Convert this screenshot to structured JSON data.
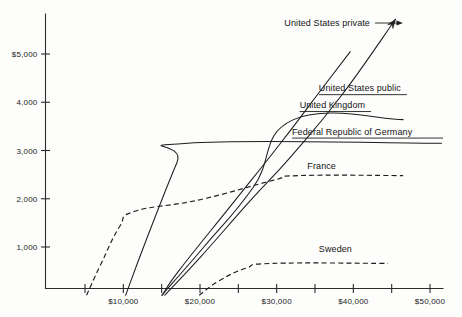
{
  "chart_data": {
    "type": "line",
    "title": "",
    "subtitle": "",
    "xlabel": "",
    "ylabel": "",
    "xlim": [
      0,
      52000
    ],
    "ylim": [
      0,
      5800
    ],
    "grid": false,
    "legend_position": "inline-right-of-series",
    "x_ticks": [
      {
        "value": 5000,
        "label": ""
      },
      {
        "value": 10000,
        "label": "$10,000"
      },
      {
        "value": 15000,
        "label": ""
      },
      {
        "value": 20000,
        "label": "$20,000"
      },
      {
        "value": 25000,
        "label": ""
      },
      {
        "value": 30000,
        "label": "$30,000"
      },
      {
        "value": 35000,
        "label": ""
      },
      {
        "value": 40000,
        "label": "$40,000"
      },
      {
        "value": 45000,
        "label": ""
      },
      {
        "value": 50000,
        "label": "$50,000"
      }
    ],
    "y_ticks": [
      {
        "value": 1000,
        "label": "1,000"
      },
      {
        "value": 2000,
        "label": "2,000"
      },
      {
        "value": 3000,
        "label": "3,000"
      },
      {
        "value": 4000,
        "label": "4,000"
      },
      {
        "value": 5000,
        "label": "$5,000"
      }
    ],
    "series": [
      {
        "name": "United States private",
        "label": "United States private",
        "style": "solid",
        "has_arrow": true,
        "has_pointer": true,
        "underline": false,
        "label_x": 31000,
        "label_y": 5580,
        "points": [
          {
            "x": 15400,
            "y": 0
          },
          {
            "x": 20000,
            "y": 780
          },
          {
            "x": 26500,
            "y": 1950
          },
          {
            "x": 32000,
            "y": 2900
          },
          {
            "x": 38500,
            "y": 4150
          },
          {
            "x": 45500,
            "y": 5720
          }
        ]
      },
      {
        "name": "United States public",
        "label": "United States public",
        "style": "solid",
        "has_arrow": false,
        "has_pointer": false,
        "underline": true,
        "label_x": 35500,
        "label_y": 4230,
        "points": [
          {
            "x": 15100,
            "y": 0
          },
          {
            "x": 17300,
            "y": 520
          },
          {
            "x": 24500,
            "y": 1950
          },
          {
            "x": 30500,
            "y": 3150
          },
          {
            "x": 36000,
            "y": 4300
          },
          {
            "x": 39600,
            "y": 5050
          }
        ]
      },
      {
        "name": "United Kingdom",
        "label": "United Kingdom",
        "style": "solid",
        "has_arrow": false,
        "has_pointer": false,
        "underline": true,
        "label_x": 33000,
        "label_y": 3880,
        "points": [
          {
            "x": 15000,
            "y": 0
          },
          {
            "x": 20500,
            "y": 1000
          },
          {
            "x": 27000,
            "y": 2250
          },
          {
            "x": 32200,
            "y": 3640
          },
          {
            "x": 46500,
            "y": 3640
          }
        ]
      },
      {
        "name": "Federal Republic of Germany",
        "label": "Federal Republic of Germany",
        "style": "solid",
        "has_arrow": false,
        "has_pointer": false,
        "underline": true,
        "label_x": 32000,
        "label_y": 3330,
        "points": [
          {
            "x": 10300,
            "y": 0
          },
          {
            "x": 13000,
            "y": 1150
          },
          {
            "x": 17000,
            "y": 2750
          },
          {
            "x": 18400,
            "y": 3150
          },
          {
            "x": 51500,
            "y": 3150
          }
        ]
      },
      {
        "name": "France",
        "label": "France",
        "style": "dashed",
        "has_arrow": false,
        "has_pointer": false,
        "underline": false,
        "label_x": 34000,
        "label_y": 2620,
        "points": [
          {
            "x": 5200,
            "y": 0
          },
          {
            "x": 7000,
            "y": 620
          },
          {
            "x": 9500,
            "y": 1420
          },
          {
            "x": 11500,
            "y": 1740
          },
          {
            "x": 20000,
            "y": 1980
          },
          {
            "x": 29500,
            "y": 2380
          },
          {
            "x": 33000,
            "y": 2480
          },
          {
            "x": 46500,
            "y": 2480
          }
        ]
      },
      {
        "name": "Sweden",
        "label": "Sweden",
        "style": "dashed",
        "has_arrow": false,
        "has_pointer": false,
        "underline": false,
        "label_x": 35500,
        "label_y": 900,
        "points": [
          {
            "x": 19900,
            "y": 0
          },
          {
            "x": 22500,
            "y": 300
          },
          {
            "x": 26000,
            "y": 560
          },
          {
            "x": 29500,
            "y": 660
          },
          {
            "x": 44500,
            "y": 660
          }
        ]
      }
    ]
  },
  "colors": {
    "background": "#fdfdfc",
    "ink": "#1d1d1d",
    "axis": "#2b2b2b"
  }
}
